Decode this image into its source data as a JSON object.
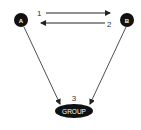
{
  "diagram": {
    "nodes": [
      {
        "id": "A",
        "label": "A"
      },
      {
        "id": "B",
        "label": "B"
      },
      {
        "id": "group",
        "label": "GROUP"
      }
    ],
    "edges": [
      {
        "from": "A",
        "to": "B",
        "label": "1"
      },
      {
        "from": "B",
        "to": "A",
        "label": "2"
      },
      {
        "from": "A",
        "to": "group",
        "label": ""
      },
      {
        "from": "B",
        "to": "group",
        "label": ""
      }
    ],
    "group_label_number": "3",
    "colors": {
      "node": "#111111",
      "line": "#222222",
      "text": "#333333"
    }
  }
}
